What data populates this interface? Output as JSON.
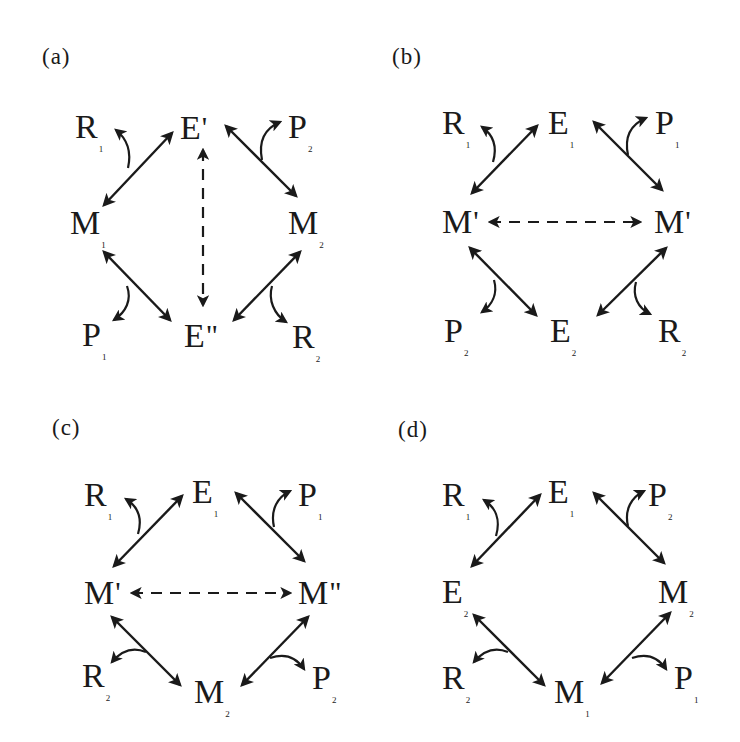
{
  "figure": {
    "panels": [
      {
        "id": "a",
        "label": "(a)",
        "nodes": {
          "tl": {
            "base": "R",
            "sub": "1",
            "prime": ""
          },
          "top": {
            "base": "E",
            "sub": "",
            "prime": "'"
          },
          "tr": {
            "base": "P",
            "sub": "2",
            "prime": ""
          },
          "ml": {
            "base": "M",
            "sub": "1",
            "prime": ""
          },
          "mr": {
            "base": "M",
            "sub": "2",
            "prime": ""
          },
          "bl": {
            "base": "P",
            "sub": "1",
            "prime": ""
          },
          "bot": {
            "base": "E",
            "sub": "",
            "prime": "\""
          },
          "br": {
            "base": "R",
            "sub": "2",
            "prime": ""
          }
        },
        "dashed_link": "vertical: E' ↔ E\""
      },
      {
        "id": "b",
        "label": "(b)",
        "nodes": {
          "tl": {
            "base": "R",
            "sub": "1",
            "prime": ""
          },
          "top": {
            "base": "E",
            "sub": "1",
            "prime": ""
          },
          "tr": {
            "base": "P",
            "sub": "1",
            "prime": ""
          },
          "ml": {
            "base": "M",
            "sub": "",
            "prime": "'"
          },
          "mr": {
            "base": "M",
            "sub": "",
            "prime": "'"
          },
          "bl": {
            "base": "P",
            "sub": "2",
            "prime": ""
          },
          "bot": {
            "base": "E",
            "sub": "2",
            "prime": ""
          },
          "br": {
            "base": "R",
            "sub": "2",
            "prime": ""
          }
        },
        "dashed_link": "horizontal: M' ↔ M'"
      },
      {
        "id": "c",
        "label": "(c)",
        "nodes": {
          "tl": {
            "base": "R",
            "sub": "1",
            "prime": ""
          },
          "top": {
            "base": "E",
            "sub": "1",
            "prime": ""
          },
          "tr": {
            "base": "P",
            "sub": "1",
            "prime": ""
          },
          "ml": {
            "base": "M",
            "sub": "",
            "prime": "'"
          },
          "mr": {
            "base": "M",
            "sub": "",
            "prime": "\""
          },
          "bl": {
            "base": "R",
            "sub": "2",
            "prime": ""
          },
          "bot": {
            "base": "M",
            "sub": "2",
            "prime": ""
          },
          "br": {
            "base": "P",
            "sub": "2",
            "prime": ""
          }
        },
        "dashed_link": "horizontal: M' ↔ M\""
      },
      {
        "id": "d",
        "label": "(d)",
        "nodes": {
          "tl": {
            "base": "R",
            "sub": "1",
            "prime": ""
          },
          "top": {
            "base": "E",
            "sub": "1",
            "prime": ""
          },
          "tr": {
            "base": "P",
            "sub": "2",
            "prime": ""
          },
          "ml": {
            "base": "E",
            "sub": "2",
            "prime": ""
          },
          "mr": {
            "base": "M",
            "sub": "2",
            "prime": ""
          },
          "bl": {
            "base": "R",
            "sub": "2",
            "prime": ""
          },
          "bot": {
            "base": "M",
            "sub": "1",
            "prime": ""
          },
          "br": {
            "base": "P",
            "sub": "1",
            "prime": ""
          }
        },
        "dashed_link": "none"
      }
    ]
  }
}
